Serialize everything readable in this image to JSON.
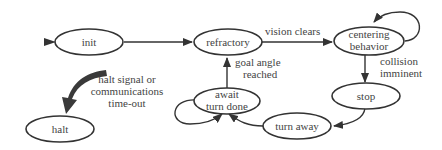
{
  "diagram": {
    "type": "state-machine",
    "nodes": {
      "init": {
        "label": "init"
      },
      "refractory": {
        "label": "refractory"
      },
      "centering": {
        "line1": "centering",
        "line2": "behavior"
      },
      "stop": {
        "label": "stop"
      },
      "turn_away": {
        "label": "turn away"
      },
      "await": {
        "line1": "await",
        "line2": "turn done"
      },
      "halt": {
        "label": "halt"
      }
    },
    "edges": {
      "vision_clears": {
        "label": "vision clears"
      },
      "collision": {
        "line1": "collision",
        "line2": "imminent"
      },
      "goal_angle": {
        "line1": "goal angle",
        "line2": "reached"
      },
      "halt_signal": {
        "line1": "halt signal or",
        "line2": "communications",
        "line3": "time-out"
      }
    },
    "colors": {
      "stroke": "#333333",
      "text": "#444444",
      "background": "#ffffff"
    }
  }
}
